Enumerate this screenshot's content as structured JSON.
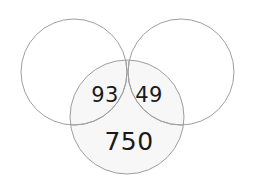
{
  "diagram": {
    "type": "venn-diagram",
    "set_count": 3,
    "background_color": "#ffffff",
    "stroke_color": "#9e9e9e",
    "stroke_width": 1,
    "fill_color": "#f7f7f7",
    "text_color": "#1a1a1a",
    "circles": [
      {
        "id": "top-left-circle",
        "name": "top-left-circle",
        "cx": 74,
        "cy": 72,
        "r": 53,
        "filled": false,
        "label": ""
      },
      {
        "id": "top-right-circle",
        "name": "top-right-circle",
        "cx": 181,
        "cy": 72,
        "r": 53,
        "filled": false,
        "label": ""
      },
      {
        "id": "bottom-circle",
        "name": "bottom-circle",
        "cx": 127,
        "cy": 117,
        "r": 57,
        "filled": true,
        "label": ""
      }
    ],
    "regions": [
      {
        "id": "left-lens",
        "name": "left-lens-region",
        "description": "overlap of top-left circle and bottom circle",
        "value": "93",
        "x": 105,
        "y": 95
      },
      {
        "id": "right-lens",
        "name": "right-lens-region",
        "description": "overlap of top-right circle and bottom circle",
        "value": "49",
        "x": 149,
        "y": 95
      },
      {
        "id": "bottom-only",
        "name": "bottom-only-region",
        "description": "bottom circle exclusive area",
        "value": "750",
        "x": 129,
        "y": 141
      }
    ]
  }
}
